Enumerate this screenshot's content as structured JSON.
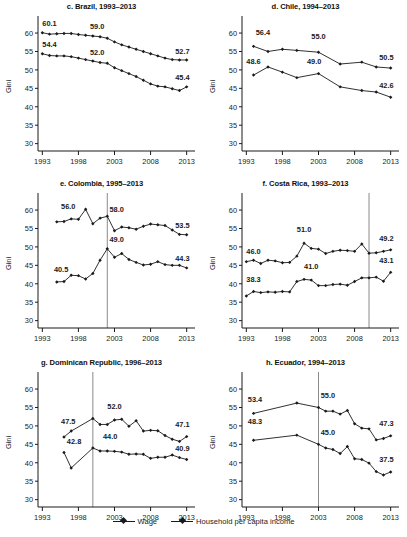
{
  "figure": {
    "ylabel": "Gini",
    "y_ticks": [
      30,
      35,
      40,
      45,
      50,
      55,
      60
    ],
    "x_ticks": [
      1993,
      1998,
      2003,
      2008,
      2013
    ],
    "ylim": [
      28,
      63
    ],
    "xlim": [
      1992.4,
      2013.6
    ],
    "legend": [
      {
        "label": "Wage",
        "marker": "diamond"
      },
      {
        "label": "Household per capita income",
        "marker": "diamond"
      }
    ],
    "series_color": "#1a1a1a",
    "vline_color": "#8a8a8a"
  },
  "chart_data": [
    {
      "id": "brazil",
      "type": "line",
      "title": "c. Brazil, 1993–2013",
      "xlabel": "",
      "ylabel": "Gini",
      "ylim": [
        28,
        63
      ],
      "xlim": [
        1992.4,
        2013.6
      ],
      "grid": false,
      "vline": null,
      "annotations": [
        {
          "text": "60.1",
          "x": 1993.0,
          "y": 61.8,
          "anchor": "start"
        },
        {
          "text": "59.0",
          "x": 2000.6,
          "y": 61.0,
          "anchor": "middle"
        },
        {
          "text": "52.7",
          "x": 2013.4,
          "y": 54.2,
          "anchor": "end"
        },
        {
          "text": "54.4",
          "x": 1993.0,
          "y": 56.2,
          "anchor": "start"
        },
        {
          "text": "52.0",
          "x": 2000.6,
          "y": 54.0,
          "anchor": "middle"
        },
        {
          "text": "45.4",
          "x": 2013.4,
          "y": 47.3,
          "anchor": "end"
        }
      ],
      "series": [
        {
          "name": "Household per capita income",
          "x": [
            1993,
            1994,
            1995,
            1996,
            1997,
            1998,
            1999,
            2000,
            2001,
            2002,
            2003,
            2004,
            2005,
            2006,
            2007,
            2008,
            2009,
            2010,
            2011,
            2012,
            2013
          ],
          "values": [
            60.1,
            59.7,
            59.8,
            59.9,
            59.9,
            59.6,
            59.4,
            59.2,
            59.0,
            58.6,
            57.6,
            56.8,
            56.2,
            55.6,
            55.0,
            54.4,
            53.8,
            53.2,
            52.8,
            52.7,
            52.7
          ]
        },
        {
          "name": "Wage",
          "x": [
            1993,
            1994,
            1995,
            1996,
            1997,
            1998,
            1999,
            2000,
            2001,
            2002,
            2003,
            2004,
            2005,
            2006,
            2007,
            2008,
            2009,
            2010,
            2011,
            2012,
            2013
          ],
          "values": [
            54.4,
            53.9,
            53.8,
            53.8,
            53.6,
            53.2,
            52.8,
            52.4,
            52.0,
            51.8,
            50.6,
            49.8,
            49.0,
            48.2,
            47.2,
            46.2,
            45.6,
            45.4,
            44.9,
            44.4,
            45.4
          ]
        }
      ]
    },
    {
      "id": "chile",
      "type": "line",
      "title": "d. Chile, 1994–2013",
      "xlabel": "",
      "ylabel": "Gini",
      "ylim": [
        28,
        63
      ],
      "xlim": [
        1992.4,
        2013.6
      ],
      "grid": false,
      "vline": null,
      "annotations": [
        {
          "text": "56.4",
          "x": 1994.3,
          "y": 59.6,
          "anchor": "start"
        },
        {
          "text": "55.0",
          "x": 2003.0,
          "y": 58.4,
          "anchor": "middle"
        },
        {
          "text": "50.5",
          "x": 2013.4,
          "y": 52.6,
          "anchor": "end"
        },
        {
          "text": "48.6",
          "x": 1993.0,
          "y": 51.6,
          "anchor": "start"
        },
        {
          "text": "49.0",
          "x": 2002.4,
          "y": 51.7,
          "anchor": "middle"
        },
        {
          "text": "42.6",
          "x": 2013.4,
          "y": 45.2,
          "anchor": "end"
        }
      ],
      "series": [
        {
          "name": "Household per capita income",
          "x": [
            1994,
            1996,
            1998,
            2000,
            2003,
            2006,
            2009,
            2011,
            2013
          ],
          "values": [
            56.4,
            55.0,
            55.6,
            55.3,
            54.8,
            51.6,
            52.1,
            50.8,
            50.5
          ]
        },
        {
          "name": "Wage",
          "x": [
            1994,
            1996,
            1998,
            2000,
            2003,
            2006,
            2009,
            2011,
            2013
          ],
          "values": [
            48.6,
            50.8,
            49.4,
            47.9,
            49.0,
            45.4,
            44.4,
            44.0,
            42.6
          ]
        }
      ]
    },
    {
      "id": "colombia",
      "type": "line",
      "title": "e. Colombia, 1995–2013",
      "xlabel": "",
      "ylabel": "Gini",
      "ylim": [
        28,
        63
      ],
      "xlim": [
        1992.4,
        2013.6
      ],
      "grid": false,
      "vline": 2002,
      "annotations": [
        {
          "text": "56.0",
          "x": 1995.6,
          "y": 60.4,
          "anchor": "start"
        },
        {
          "text": "58.0",
          "x": 2002.3,
          "y": 59.6,
          "anchor": "start"
        },
        {
          "text": "53.5",
          "x": 2013.4,
          "y": 55.2,
          "anchor": "end"
        },
        {
          "text": "40.5",
          "x": 1994.6,
          "y": 43.2,
          "anchor": "start"
        },
        {
          "text": "49.0",
          "x": 2002.3,
          "y": 51.3,
          "anchor": "start"
        },
        {
          "text": "44.3",
          "x": 2013.4,
          "y": 46.3,
          "anchor": "end"
        }
      ],
      "series": [
        {
          "name": "Household per capita income",
          "x": [
            1995,
            1996,
            1997,
            1998,
            1999,
            2000,
            2001,
            2002,
            2003,
            2004,
            2005,
            2006,
            2007,
            2008,
            2009,
            2010,
            2011,
            2012,
            2013
          ],
          "values": [
            56.8,
            56.9,
            57.6,
            57.5,
            60.2,
            56.3,
            57.8,
            58.3,
            54.4,
            55.4,
            55.2,
            54.8,
            55.6,
            56.2,
            56.0,
            55.8,
            54.6,
            53.4,
            53.3
          ]
        },
        {
          "name": "Wage",
          "x": [
            1995,
            1996,
            1997,
            1998,
            1999,
            2000,
            2001,
            2002,
            2003,
            2004,
            2005,
            2006,
            2007,
            2008,
            2009,
            2010,
            2011,
            2012,
            2013
          ],
          "values": [
            40.5,
            40.6,
            42.3,
            42.2,
            41.3,
            42.8,
            46.4,
            49.5,
            47.2,
            48.2,
            46.6,
            45.8,
            45.1,
            45.3,
            46.0,
            45.2,
            45.0,
            45.0,
            44.3
          ]
        }
      ]
    },
    {
      "id": "costarica",
      "type": "line",
      "title": "f. Costa Rica, 1993–2013",
      "xlabel": "",
      "ylabel": "Gini",
      "ylim": [
        28,
        63
      ],
      "xlim": [
        1992.4,
        2013.6
      ],
      "grid": false,
      "vline": 2010,
      "annotations": [
        {
          "text": "46.0",
          "x": 1993.0,
          "y": 48.2,
          "anchor": "start"
        },
        {
          "text": "51.0",
          "x": 2001.0,
          "y": 54.0,
          "anchor": "middle"
        },
        {
          "text": "49.2",
          "x": 2013.4,
          "y": 51.6,
          "anchor": "end"
        },
        {
          "text": "38.3",
          "x": 1993.0,
          "y": 40.6,
          "anchor": "start"
        },
        {
          "text": "41.0",
          "x": 2002.0,
          "y": 43.9,
          "anchor": "middle"
        },
        {
          "text": "43.1",
          "x": 2013.4,
          "y": 45.6,
          "anchor": "end"
        }
      ],
      "series": [
        {
          "name": "Household per capita income",
          "x": [
            1993,
            1994,
            1995,
            1996,
            1997,
            1998,
            1999,
            2000,
            2001,
            2002,
            2003,
            2004,
            2005,
            2006,
            2007,
            2008,
            2009,
            2010,
            2011,
            2012,
            2013
          ],
          "values": [
            46.0,
            46.4,
            45.5,
            46.4,
            46.2,
            45.7,
            45.8,
            47.5,
            51.0,
            49.6,
            49.4,
            48.2,
            48.8,
            49.1,
            49.0,
            48.8,
            50.8,
            48.3,
            48.4,
            48.8,
            49.2
          ]
        },
        {
          "name": "Wage",
          "x": [
            1993,
            1994,
            1995,
            1996,
            1997,
            1998,
            1999,
            2000,
            2001,
            2002,
            2003,
            2004,
            2005,
            2006,
            2007,
            2008,
            2009,
            2010,
            2011,
            2012,
            2013
          ],
          "values": [
            36.7,
            37.9,
            37.6,
            37.8,
            37.7,
            37.9,
            37.8,
            40.6,
            41.2,
            41.0,
            39.5,
            39.5,
            39.8,
            39.9,
            39.6,
            40.6,
            41.6,
            41.6,
            41.8,
            40.7,
            43.1
          ]
        }
      ]
    },
    {
      "id": "dominican",
      "type": "line",
      "title": "g. Dominican Republic, 1996–2013",
      "xlabel": "",
      "ylabel": "Gini",
      "ylim": [
        28,
        63
      ],
      "xlim": [
        1992.4,
        2013.6
      ],
      "grid": false,
      "vline": 2000,
      "annotations": [
        {
          "text": "47.5",
          "x": 1995.6,
          "y": 50.4,
          "anchor": "start"
        },
        {
          "text": "52.0",
          "x": 2003.0,
          "y": 54.6,
          "anchor": "middle"
        },
        {
          "text": "47.1",
          "x": 2013.4,
          "y": 49.6,
          "anchor": "end"
        },
        {
          "text": "42.8",
          "x": 1996.4,
          "y": 45.2,
          "anchor": "start"
        },
        {
          "text": "44.0",
          "x": 2002.4,
          "y": 46.4,
          "anchor": "middle"
        },
        {
          "text": "40.9",
          "x": 2013.4,
          "y": 43.2,
          "anchor": "end"
        }
      ],
      "series": [
        {
          "name": "Household per capita income",
          "x": [
            1996,
            1997,
            2000,
            2001,
            2002,
            2003,
            2004,
            2005,
            2006,
            2007,
            2008,
            2009,
            2010,
            2011,
            2012,
            2013
          ],
          "values": [
            47.0,
            48.6,
            52.0,
            50.4,
            50.4,
            51.6,
            51.8,
            49.9,
            51.4,
            48.6,
            48.8,
            48.7,
            47.4,
            46.4,
            45.8,
            47.1
          ]
        },
        {
          "name": "Wage",
          "x": [
            1996,
            1997,
            2000,
            2001,
            2002,
            2003,
            2004,
            2005,
            2006,
            2007,
            2008,
            2009,
            2010,
            2011,
            2012,
            2013
          ],
          "values": [
            42.8,
            38.6,
            44.0,
            43.2,
            43.2,
            43.1,
            42.9,
            42.3,
            42.4,
            42.3,
            41.2,
            41.5,
            41.5,
            42.1,
            41.4,
            40.9
          ]
        }
      ]
    },
    {
      "id": "ecuador",
      "type": "line",
      "title": "h. Ecuador, 1994–2013",
      "xlabel": "",
      "ylabel": "Gini",
      "ylim": [
        28,
        63
      ],
      "xlim": [
        1992.4,
        2013.6
      ],
      "grid": false,
      "vline": 2003,
      "annotations": [
        {
          "text": "53.4",
          "x": 1993.2,
          "y": 56.4,
          "anchor": "start"
        },
        {
          "text": "55.0",
          "x": 2003.3,
          "y": 57.6,
          "anchor": "start"
        },
        {
          "text": "47.3",
          "x": 2013.4,
          "y": 49.9,
          "anchor": "end"
        },
        {
          "text": "48.3",
          "x": 1993.2,
          "y": 50.5,
          "anchor": "start"
        },
        {
          "text": "45.0",
          "x": 2003.3,
          "y": 47.4,
          "anchor": "start"
        },
        {
          "text": "37.5",
          "x": 2013.4,
          "y": 40.3,
          "anchor": "end"
        }
      ],
      "series": [
        {
          "name": "Household per capita income",
          "x": [
            1994,
            2000,
            2003,
            2004,
            2005,
            2006,
            2007,
            2008,
            2009,
            2010,
            2011,
            2012,
            2013
          ],
          "values": [
            53.4,
            56.2,
            55.0,
            54.0,
            54.0,
            53.2,
            54.2,
            50.6,
            49.4,
            49.2,
            46.2,
            46.6,
            47.3
          ]
        },
        {
          "name": "Wage",
          "x": [
            1994,
            2000,
            2003,
            2004,
            2005,
            2006,
            2007,
            2008,
            2009,
            2010,
            2011,
            2012,
            2013
          ],
          "values": [
            46.1,
            47.5,
            45.0,
            44.0,
            43.6,
            42.5,
            44.4,
            41.1,
            40.9,
            39.9,
            37.6,
            36.7,
            37.5
          ]
        }
      ]
    }
  ]
}
